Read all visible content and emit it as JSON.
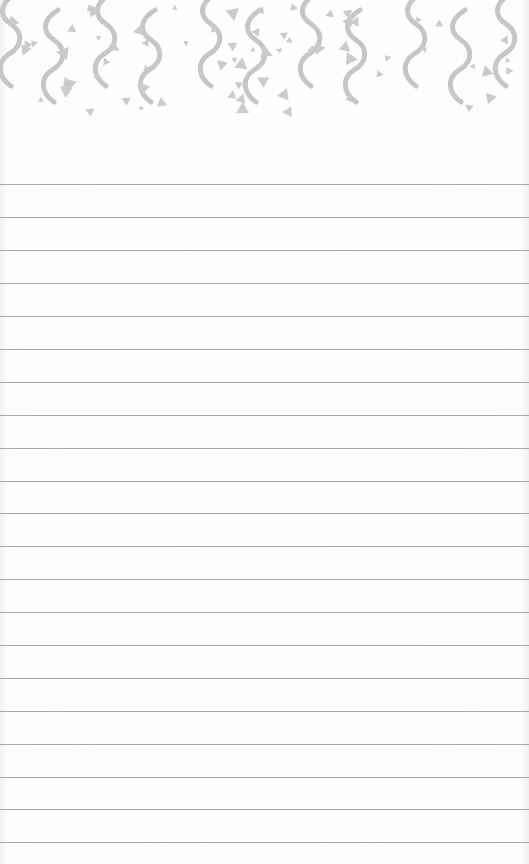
{
  "page": {
    "type": "lined-notepad",
    "background_color": "#fcfcfc",
    "rule_color": "#9a9a9a",
    "pattern_color": "#c4c4c4"
  },
  "header_pattern": {
    "motifs": [
      "squiggle",
      "triangle"
    ],
    "squiggle_x": [
      5,
      48,
      100,
      145,
      205,
      250,
      305,
      350,
      410,
      455,
      500
    ],
    "height": 120
  },
  "rules": {
    "count": 21,
    "y_positions": [
      184,
      217,
      250,
      283,
      316,
      349,
      382,
      415,
      448,
      481,
      513,
      546,
      579,
      612,
      645,
      678,
      711,
      744,
      777,
      809,
      842
    ]
  }
}
